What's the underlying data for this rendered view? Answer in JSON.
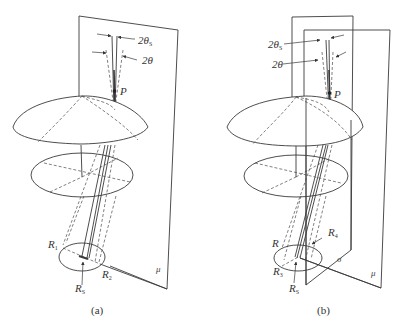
{
  "figure": {
    "panels": [
      {
        "id": "a",
        "caption": "(a)",
        "labels": {
          "angle_s": "2θ",
          "angle_s_sub": "S",
          "angle": "2θ",
          "point": "P",
          "r1": "R",
          "r1_sub": "1",
          "r2": "R",
          "r2_sub": "2",
          "rs": "R",
          "rs_sub": "S",
          "plane_mu": "μ"
        }
      },
      {
        "id": "b",
        "caption": "(b)",
        "labels": {
          "angle_s": "2θ",
          "angle_s_sub": "S",
          "angle": "2θ",
          "point": "P",
          "r": "R",
          "r3": "R",
          "r3_sub": "3",
          "r4": "R",
          "r4_sub": "4",
          "rs": "R",
          "rs_sub": "S",
          "plane_sigma": "σ",
          "plane_mu": "μ"
        }
      }
    ]
  }
}
